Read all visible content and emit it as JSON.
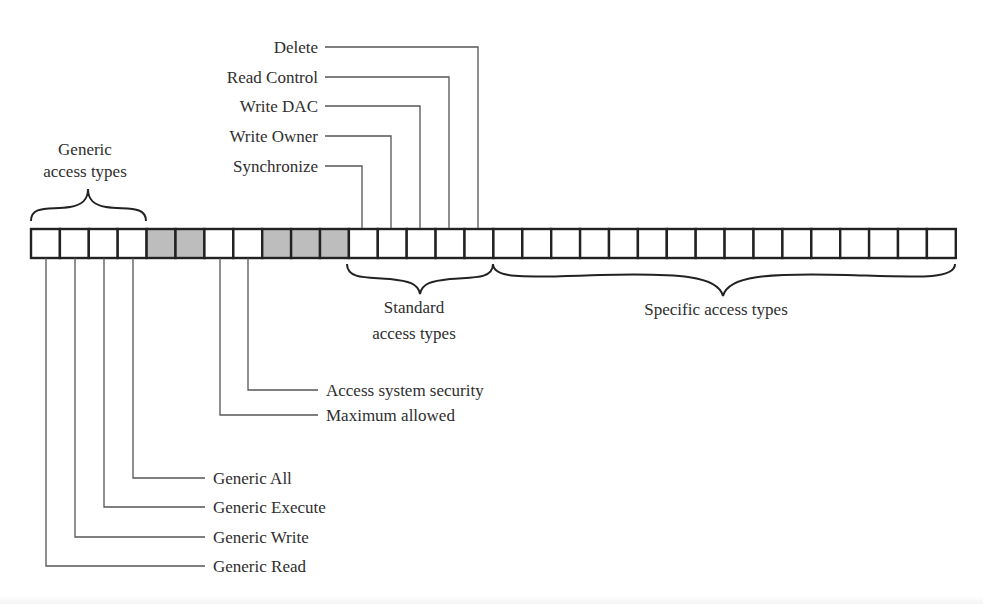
{
  "diagram": {
    "colors": {
      "reserved_fill": "#bdbdbd",
      "cell_fill": "#ffffff",
      "stroke": "#222222",
      "line": "#555555"
    },
    "bits": {
      "count": 32,
      "cells": [
        {
          "index": 0,
          "group": "generic"
        },
        {
          "index": 1,
          "group": "generic"
        },
        {
          "index": 2,
          "group": "generic"
        },
        {
          "index": 3,
          "group": "generic"
        },
        {
          "index": 4,
          "group": "reserved"
        },
        {
          "index": 5,
          "group": "reserved"
        },
        {
          "index": 6,
          "group": "special"
        },
        {
          "index": 7,
          "group": "special"
        },
        {
          "index": 8,
          "group": "reserved"
        },
        {
          "index": 9,
          "group": "reserved"
        },
        {
          "index": 10,
          "group": "reserved"
        },
        {
          "index": 11,
          "group": "standard"
        },
        {
          "index": 12,
          "group": "standard"
        },
        {
          "index": 13,
          "group": "standard"
        },
        {
          "index": 14,
          "group": "standard"
        },
        {
          "index": 15,
          "group": "standard"
        },
        {
          "index": 16,
          "group": "specific"
        },
        {
          "index": 17,
          "group": "specific"
        },
        {
          "index": 18,
          "group": "specific"
        },
        {
          "index": 19,
          "group": "specific"
        },
        {
          "index": 20,
          "group": "specific"
        },
        {
          "index": 21,
          "group": "specific"
        },
        {
          "index": 22,
          "group": "specific"
        },
        {
          "index": 23,
          "group": "specific"
        },
        {
          "index": 24,
          "group": "specific"
        },
        {
          "index": 25,
          "group": "specific"
        },
        {
          "index": 26,
          "group": "specific"
        },
        {
          "index": 27,
          "group": "specific"
        },
        {
          "index": 28,
          "group": "specific"
        },
        {
          "index": 29,
          "group": "specific"
        },
        {
          "index": 30,
          "group": "specific"
        },
        {
          "index": 31,
          "group": "specific"
        }
      ]
    },
    "groups": {
      "generic": {
        "line1": "Generic",
        "line2": "access types"
      },
      "standard": {
        "line1": "Standard",
        "line2": "access types"
      },
      "specific": {
        "label": "Specific access types"
      }
    },
    "top_labels": [
      {
        "label": "Delete",
        "cell": 15
      },
      {
        "label": "Read Control",
        "cell": 14
      },
      {
        "label": "Write DAC",
        "cell": 13
      },
      {
        "label": "Write Owner",
        "cell": 12
      },
      {
        "label": "Synchronize",
        "cell": 11
      }
    ],
    "bottom_labels_special": [
      {
        "label": "Access system security",
        "cell": 7
      },
      {
        "label": "Maximum allowed",
        "cell": 6
      }
    ],
    "bottom_labels_generic": [
      {
        "label": "Generic All",
        "cell": 3
      },
      {
        "label": "Generic Execute",
        "cell": 2
      },
      {
        "label": "Generic Write",
        "cell": 1
      },
      {
        "label": "Generic Read",
        "cell": 0
      }
    ]
  }
}
